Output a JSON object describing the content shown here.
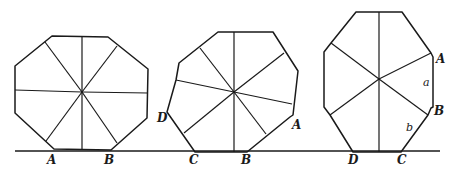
{
  "figure": {
    "ground_line": {
      "y": 151,
      "x1": 15,
      "x2": 440
    },
    "shapes": [
      {
        "name": "regular-octagon",
        "points": "52,36 108,37 148,69 147,118 111,150 54,149 15,113 15,66",
        "center": [
          82,
          92
        ],
        "spokes": [
          [
            82,
            37
          ],
          [
            82,
            150
          ],
          [
            15,
            90
          ],
          [
            148,
            93
          ],
          [
            45,
            42
          ],
          [
            117,
            143
          ],
          [
            117,
            46
          ],
          [
            46,
            141
          ]
        ],
        "labels": [
          {
            "text": "A",
            "x": 47,
            "y": 164
          },
          {
            "text": "B",
            "x": 104,
            "y": 164
          }
        ]
      },
      {
        "name": "irregular-octagon-tilted",
        "points": "218,32 273,32 298,71 293,115 290,117 247,152 195,152 167,112 176,80 179,63",
        "center": [
          234,
          92
        ],
        "spokes": [
          [
            234,
            32
          ],
          [
            234,
            152
          ],
          [
            176,
            80
          ],
          [
            292,
            104
          ],
          [
            200,
            48
          ],
          [
            266,
            134
          ],
          [
            284,
            53
          ],
          [
            184,
            133
          ]
        ],
        "labels": [
          {
            "text": "D",
            "x": 157,
            "y": 122
          },
          {
            "text": "A",
            "x": 292,
            "y": 129
          },
          {
            "text": "C",
            "x": 189,
            "y": 164
          },
          {
            "text": "B",
            "x": 241,
            "y": 164
          }
        ]
      },
      {
        "name": "elongated-octagon",
        "points": "356,12 402,12 431,53 433,57 433,107 431,108 428,115 401,152 353,152 330,115 324,107 324,52 331,43",
        "center": [
          379,
          79
        ],
        "spokes": [
          [
            379,
            12
          ],
          [
            379,
            152
          ],
          [
            331,
            43
          ],
          [
            428,
            115
          ],
          [
            431,
            53
          ],
          [
            330,
            115
          ]
        ],
        "labels": [
          {
            "text": "A",
            "x": 436,
            "y": 63
          },
          {
            "text": "a",
            "x": 423,
            "y": 86,
            "small": true
          },
          {
            "text": "B",
            "x": 434,
            "y": 115
          },
          {
            "text": "b",
            "x": 406,
            "y": 131,
            "small": true
          },
          {
            "text": "D",
            "x": 348,
            "y": 164
          },
          {
            "text": "C",
            "x": 397,
            "y": 164
          }
        ]
      }
    ],
    "stroke_color": "#1a1a1a"
  }
}
